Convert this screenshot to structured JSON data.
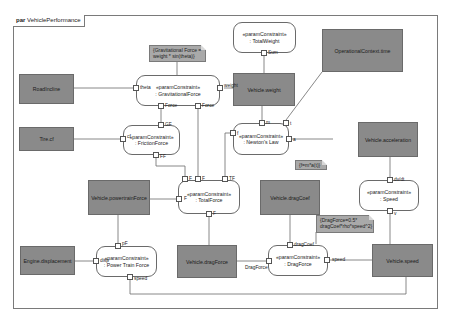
{
  "diagram": {
    "kind": "par",
    "name": "VehiclePerformance"
  },
  "blocks": {
    "road_incline": "RoadIncline",
    "tire_cf": "Tire.cf",
    "vehicle_weight": "Vehicle.weight",
    "operational_context_time": "OperationalContext.time",
    "vehicle_acceleration": "Vehicle.acceleration",
    "vehicle_powertrain_force": "Vehicle.powertrainForce",
    "vehicle_drag_coef": "Vehicle.dragCoef",
    "engine_displacement": "Engine.displacement",
    "vehicle_drag_force": "Vehicle.dragForce",
    "vehicle_speed": "Vehicle.speed"
  },
  "constraints": {
    "total_weight": {
      "stereotype": "«paramConstraint»",
      "name": ": TotalWeight"
    },
    "gravitational_force": {
      "stereotype": "«paramConstraint»",
      "name": ": GravitationalForce"
    },
    "friction_force": {
      "stereotype": "«paramConstraint»",
      "name": ": FrictionForce"
    },
    "newtons_law": {
      "stereotype": "«paramConstraint»",
      "name": ": Newton's Law"
    },
    "total_force": {
      "stereotype": "«paramConstraint»",
      "name": ": TotalForce"
    },
    "speed": {
      "stereotype": "«paramConstraint»",
      "name": ": Speed"
    },
    "power_train_force": {
      "stereotype": "«paramConstraint»",
      "name": ": Power Train Force"
    },
    "drag_force": {
      "stereotype": "«paramConstraint»",
      "name": ": DragForce"
    }
  },
  "ports": {
    "tw_sum": "Sum",
    "gf_theta": "theta",
    "gf_weight": "weight",
    "gf_force1": "Force",
    "gf_force2": "Force",
    "ff_gf": "GF",
    "ff_cf": "cf",
    "ff_ff": "FF",
    "nl_m": "m",
    "nl_t": "t",
    "nl_f": "f",
    "nl_a": "a",
    "tf_f1": "F",
    "tf_f2": "F",
    "tf_tf": "TF",
    "tf_f3": "F",
    "tf_f4": "F",
    "sp_dvdt": "dv/dt",
    "sp_v": "v",
    "ptf_pf": "pF",
    "ptf_disp": "disp",
    "ptf_speed": "speed",
    "df_dragcoef": "dragCoef",
    "df_dragforce": "DragForce",
    "df_speed": "speed"
  },
  "notes": {
    "gravitational": {
      "line1": "{Gravitational Force =",
      "line2": "weight * sin(theta)}"
    },
    "newton": {
      "line1": "{f=m*a(t)}"
    },
    "drag": {
      "line1": "{DragForce=0.5*",
      "line2": "dragCoef*rho*speed^2}"
    }
  },
  "colors": {
    "block_fill": "#8a8a8a",
    "note_fill": "#a9a9a9",
    "line": "#6a6a6a",
    "background": "#ffffff"
  }
}
